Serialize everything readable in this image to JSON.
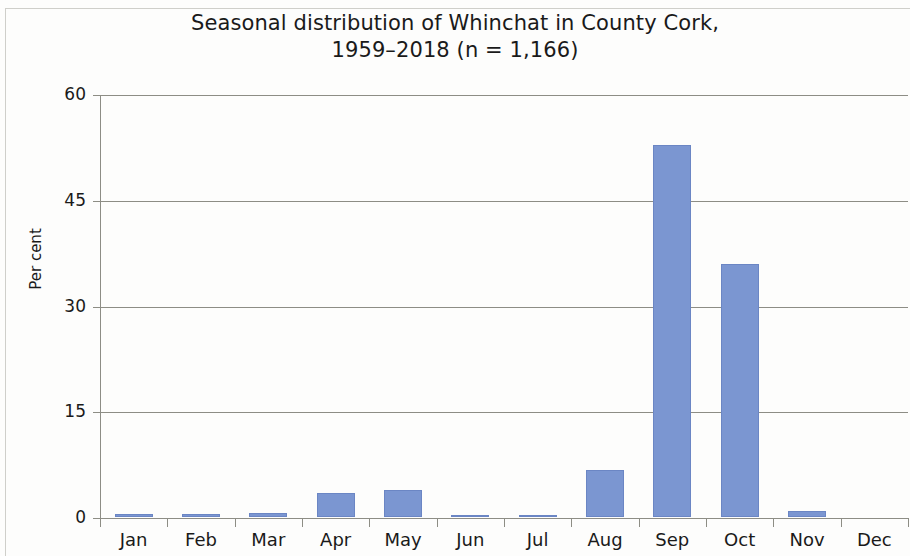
{
  "chart_data": {
    "type": "bar",
    "title": "Seasonal distribution of Whinchat in County Cork, 1959–2018 (n = 1,166)",
    "title_line1": "Seasonal distribution of Whinchat in County Cork,",
    "title_line2": "1959–2018 (n = 1,166)",
    "xlabel": "",
    "ylabel": "Per cent",
    "categories": [
      "Jan",
      "Feb",
      "Mar",
      "Apr",
      "May",
      "Jun",
      "Jul",
      "Aug",
      "Sep",
      "Oct",
      "Nov",
      "Dec"
    ],
    "values": [
      0.4,
      0.4,
      0.5,
      3.4,
      3.9,
      0.3,
      0.3,
      6.7,
      52.7,
      35.9,
      0.8,
      0
    ],
    "ylim": [
      0,
      60
    ],
    "yticks": [
      0,
      15,
      30,
      45,
      60
    ],
    "ytick_labels": [
      "0",
      "15",
      "30",
      "45",
      "60"
    ],
    "grid": true,
    "legend": false,
    "bar_color": "#7b96d1",
    "grid_color": "#8d8d85",
    "sample_size": "n = 1,166",
    "period": "1959–2018"
  }
}
